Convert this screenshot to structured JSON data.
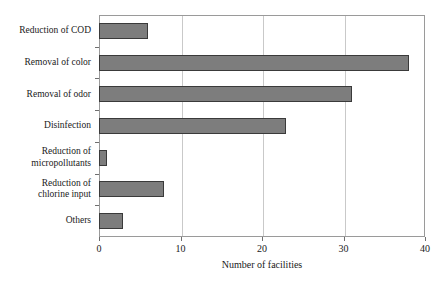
{
  "chart_data": {
    "type": "bar",
    "orientation": "horizontal",
    "title": "",
    "xlabel": "Number of facilities",
    "ylabel": "",
    "xlim": [
      0,
      40
    ],
    "xticks": [
      0,
      10,
      20,
      30,
      40
    ],
    "xticklabels": [
      "0",
      "10",
      "20",
      "30",
      "40"
    ],
    "grid": "vertical",
    "legend": "none",
    "categories": [
      "Reduction of COD",
      "Removal of color",
      "Removal of odor",
      "Disinfection",
      "Reduction of\nmicropollutants",
      "Reduction of\nchlorine input",
      "Others"
    ],
    "values": [
      6,
      38,
      31,
      23,
      1,
      8,
      3
    ],
    "colors": {
      "bar_fill": "#7d7d7d",
      "bar_border": "#3a3a3a",
      "gridline": "#c9c9c9",
      "axis": "#9a9a9a",
      "text": "#1a1a1a",
      "background": "#ffffff"
    }
  }
}
